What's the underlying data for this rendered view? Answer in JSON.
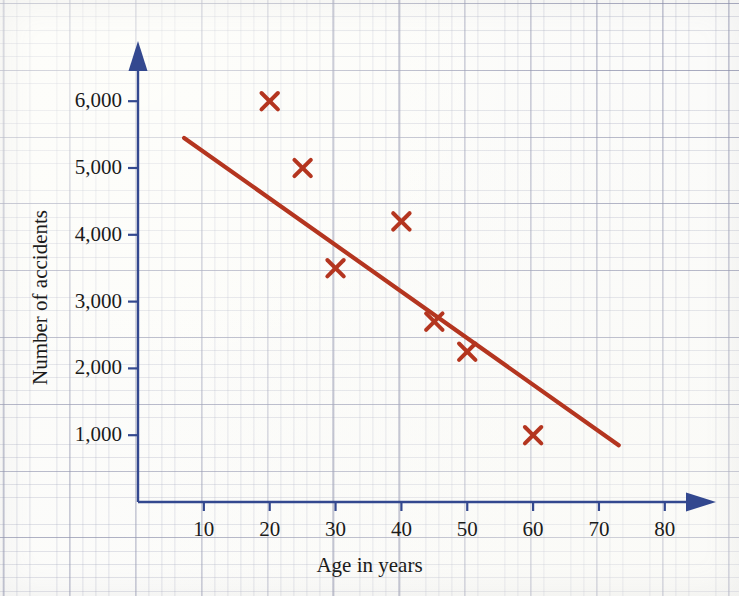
{
  "figure": {
    "kind": "scatter-plot-with-line-of-best-fit",
    "paper": "graph-paper",
    "axis_color": "#33488f",
    "data_color": "#b4351f",
    "grid_color": "#7a80a8"
  },
  "chart_data": {
    "type": "scatter",
    "title": "",
    "xlabel": "Age in years",
    "ylabel": "Number of accidents",
    "xlim": [
      0,
      88
    ],
    "ylim": [
      0,
      6800
    ],
    "grid": true,
    "legend": null,
    "x_ticks": [
      10,
      20,
      30,
      40,
      50,
      60,
      70,
      80
    ],
    "x_tick_labels": [
      "10",
      "20",
      "30",
      "40",
      "50",
      "60",
      "70",
      "80"
    ],
    "y_ticks": [
      1000,
      2000,
      3000,
      4000,
      5000,
      6000
    ],
    "y_tick_labels": [
      "1,000",
      "2,000",
      "3,000",
      "4,000",
      "5,000",
      "6,000"
    ],
    "points": [
      {
        "x": 20,
        "y": 6000
      },
      {
        "x": 25,
        "y": 5000
      },
      {
        "x": 30,
        "y": 3500
      },
      {
        "x": 40,
        "y": 4200
      },
      {
        "x": 45,
        "y": 2700
      },
      {
        "x": 50,
        "y": 2250
      },
      {
        "x": 60,
        "y": 1000
      }
    ],
    "marker": "x",
    "series": [
      {
        "name": "Line of best fit",
        "type": "line",
        "x": [
          7,
          73
        ],
        "y": [
          5450,
          850
        ]
      }
    ]
  }
}
